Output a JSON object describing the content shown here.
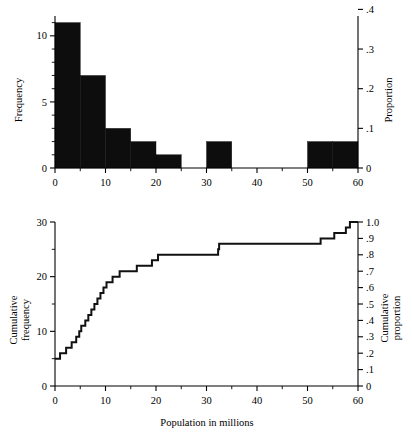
{
  "figure": {
    "xlabel": "Population in millions"
  },
  "chart_data": [
    {
      "type": "bar",
      "title": "",
      "subtitle": "",
      "panel": "top-histogram",
      "xlabel": "",
      "ylabel": "Frequency",
      "y2label": "Proportion",
      "xlim": [
        0,
        60
      ],
      "ylim": [
        0,
        11.5
      ],
      "y2lim": [
        0,
        0.4
      ],
      "grid": false,
      "legend": "none",
      "bin_width": 5,
      "n_total": 30,
      "bin_edges": [
        0,
        5,
        10,
        15,
        20,
        25,
        30,
        35,
        40,
        45,
        50,
        55,
        60
      ],
      "categories": [
        "0-5",
        "5-10",
        "10-15",
        "15-20",
        "20-25",
        "25-30",
        "30-35",
        "35-40",
        "40-45",
        "45-50",
        "50-55",
        "55-60"
      ],
      "values": [
        11,
        7,
        3,
        2,
        1,
        0,
        2,
        0,
        0,
        0,
        2,
        2
      ],
      "proportions": [
        0.367,
        0.233,
        0.1,
        0.067,
        0.033,
        0.0,
        0.067,
        0.0,
        0.0,
        0.0,
        0.067,
        0.067
      ],
      "xticks": [
        0,
        10,
        20,
        30,
        40,
        50,
        60
      ],
      "xticklabels": [
        "0",
        "10",
        "20",
        "30",
        "40",
        "50",
        "60"
      ],
      "xticks_minor": [
        5,
        15,
        25,
        35,
        45,
        55
      ],
      "yticks": [
        0,
        5,
        10
      ],
      "yticklabels": [
        "0",
        "5",
        "10"
      ],
      "yticks_minor": [
        1,
        2,
        3,
        4,
        6,
        7,
        8,
        9,
        11
      ],
      "y2ticks": [
        0,
        0.1,
        0.2,
        0.3,
        0.4
      ],
      "y2ticklabels": [
        "0",
        ".1",
        ".2",
        ".3",
        ".4"
      ]
    },
    {
      "type": "line",
      "title": "",
      "panel": "bottom-cumulative",
      "style": "step",
      "xlabel": "Population in millions",
      "ylabel": "Cumulative frequency",
      "y2label": "Cumulative proportion",
      "xlim": [
        0,
        60
      ],
      "ylim": [
        0,
        30
      ],
      "y2lim": [
        0,
        1.0
      ],
      "grid": false,
      "legend": "none",
      "n_total": 30,
      "x": [
        0.0,
        1.0,
        2.2,
        3.3,
        4.2,
        4.8,
        5.2,
        6.0,
        6.6,
        7.2,
        7.8,
        8.4,
        9.0,
        9.6,
        10.2,
        11.4,
        12.8,
        14.6,
        16.2,
        17.8,
        19.2,
        20.4,
        20.6,
        32.3,
        32.5,
        50.2,
        52.6,
        55.3,
        57.6,
        58.4,
        60.0
      ],
      "y": [
        5,
        6,
        7,
        8,
        9,
        10,
        11,
        12,
        13,
        14,
        15,
        16,
        17,
        18,
        19,
        20,
        21,
        21,
        22,
        22,
        23,
        24,
        24,
        25,
        26,
        26,
        27,
        28,
        29,
        30,
        30
      ],
      "xticks": [
        0,
        10,
        20,
        30,
        40,
        50,
        60
      ],
      "xticklabels": [
        "0",
        "10",
        "20",
        "30",
        "40",
        "50",
        "60"
      ],
      "xticks_minor": [
        5,
        15,
        25,
        35,
        45,
        55
      ],
      "yticks": [
        0,
        10,
        20,
        30
      ],
      "yticklabels": [
        "0",
        "10",
        "20",
        "30"
      ],
      "yticks_minor": [
        5,
        15,
        25
      ],
      "y2ticks": [
        0,
        0.1,
        0.2,
        0.3,
        0.4,
        0.5,
        0.6,
        0.7,
        0.8,
        0.9,
        1.0
      ],
      "y2ticklabels": [
        "0",
        ".1",
        ".2",
        ".3",
        ".4",
        ".5",
        ".6",
        ".7",
        ".8",
        ".9",
        "1.0"
      ]
    }
  ],
  "top_axis": {
    "ylabel": "Frequency",
    "y2label": "Proportion",
    "yticklabels": [
      "0",
      "5",
      "10"
    ],
    "y2ticklabels": [
      "0",
      ".1",
      ".2",
      ".3",
      ".4"
    ],
    "xticklabels": [
      "0",
      "10",
      "20",
      "30",
      "40",
      "50",
      "60"
    ]
  },
  "bottom_axis": {
    "ylabel_line1": "Cumulative",
    "ylabel_line2": "frequency",
    "y2label_line1": "Cumulative",
    "y2label_line2": "proportion",
    "yticklabels": [
      "0",
      "10",
      "20",
      "30"
    ],
    "y2ticklabels": [
      "0",
      ".1",
      ".2",
      ".3",
      ".4",
      ".5",
      ".6",
      ".7",
      ".8",
      ".9",
      "1.0"
    ],
    "xticklabels": [
      "0",
      "10",
      "20",
      "30",
      "40",
      "50",
      "60"
    ],
    "xlabel": "Population in millions"
  }
}
